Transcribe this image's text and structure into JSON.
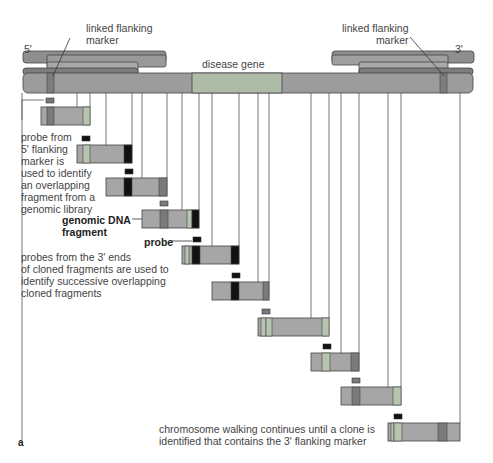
{
  "labels": {
    "five_prime": "5'",
    "three_prime": "3'",
    "left_marker": "linked flanking\nmarker",
    "right_marker": "linked flanking\nmarker",
    "disease_gene": "disease gene",
    "probe_5prime": "probe from\n5' flanking\nmarker is\nused to identify\nan overlapping\nfragment from a\ngenomic library",
    "genomic_fragment": "genomic DNA\nfragment",
    "probe": "probe",
    "probes_3prime": "probes from the 3' ends\nof cloned fragments are used to\nidentify successive overlapping\ncloned fragments",
    "walking_continues": "chromosome walking continues until a clone is\nidentified that contains the 3' flanking marker",
    "panel": "a"
  },
  "colors": {
    "chromosome": "#9c9c9c",
    "chromosome_dark": "#7d7d7d",
    "disease_gene": "#aebba6",
    "fragment": "#a6a6a6",
    "light_band": "#b6c4b0",
    "dark_band": "#7a7a7a",
    "probe_band": "#111111",
    "line": "#666666"
  },
  "fragments": [
    {
      "x": 41,
      "y": 107,
      "w": 49,
      "probe": {
        "x": 46,
        "y": 98,
        "dark": false
      },
      "bands": [
        {
          "x": 47,
          "w": 7,
          "c": "dark"
        },
        {
          "x": 83,
          "w": 7,
          "c": "light"
        }
      ]
    },
    {
      "x": 77,
      "y": 145,
      "w": 55,
      "probe": {
        "x": 82,
        "y": 136,
        "dark": true
      },
      "bands": [
        {
          "x": 83,
          "w": 7,
          "c": "light"
        },
        {
          "x": 124,
          "w": 8,
          "c": "black"
        }
      ]
    },
    {
      "x": 106,
      "y": 178,
      "w": 61,
      "probe": {
        "x": 125,
        "y": 169,
        "dark": true
      },
      "bands": [
        {
          "x": 124,
          "w": 8,
          "c": "black"
        },
        {
          "x": 159,
          "w": 8,
          "c": "dark"
        }
      ]
    },
    {
      "x": 142,
      "y": 210,
      "w": 57,
      "probe": {
        "x": 160,
        "y": 201,
        "dark": false
      },
      "bands": [
        {
          "x": 160,
          "w": 8,
          "c": "dark"
        },
        {
          "x": 187,
          "w": 5,
          "c": "light"
        },
        {
          "x": 192,
          "w": 7,
          "c": "black"
        }
      ]
    },
    {
      "x": 182,
      "y": 246,
      "w": 57,
      "probe": {
        "x": 193,
        "y": 237,
        "dark": true
      },
      "bands": [
        {
          "x": 185,
          "w": 4,
          "c": "light"
        },
        {
          "x": 192,
          "w": 8,
          "c": "black"
        },
        {
          "x": 231,
          "w": 8,
          "c": "black"
        }
      ]
    },
    {
      "x": 212,
      "y": 282,
      "w": 57,
      "probe": {
        "x": 232,
        "y": 273,
        "dark": true
      },
      "bands": [
        {
          "x": 231,
          "w": 8,
          "c": "black"
        },
        {
          "x": 263,
          "w": 6,
          "c": "dark"
        }
      ]
    },
    {
      "x": 258,
      "y": 318,
      "w": 71,
      "probe": {
        "x": 262,
        "y": 309,
        "dark": false
      },
      "bands": [
        {
          "x": 261,
          "w": 5,
          "c": "light"
        },
        {
          "x": 266,
          "w": 6,
          "c": "light"
        },
        {
          "x": 322,
          "w": 7,
          "c": "light"
        }
      ]
    },
    {
      "x": 311,
      "y": 353,
      "w": 48,
      "probe": {
        "x": 323,
        "y": 344,
        "dark": true
      },
      "bands": [
        {
          "x": 322,
          "w": 8,
          "c": "light"
        },
        {
          "x": 351,
          "w": 8,
          "c": "dark"
        }
      ]
    },
    {
      "x": 341,
      "y": 387,
      "w": 60,
      "probe": {
        "x": 352,
        "y": 378,
        "dark": false
      },
      "bands": [
        {
          "x": 352,
          "w": 8,
          "c": "dark"
        },
        {
          "x": 393,
          "w": 8,
          "c": "light"
        }
      ]
    },
    {
      "x": 388,
      "y": 423,
      "w": 72,
      "probe": {
        "x": 394,
        "y": 414,
        "dark": true
      },
      "bands": [
        {
          "x": 391,
          "w": 3,
          "c": "light"
        },
        {
          "x": 394,
          "w": 8,
          "c": "light"
        },
        {
          "x": 438,
          "w": 9,
          "c": "dark"
        }
      ]
    }
  ],
  "vlines": [
    22,
    77,
    90,
    106,
    132,
    142,
    167,
    182,
    199,
    212,
    239,
    258,
    269,
    311,
    329,
    341,
    359,
    388,
    401,
    460
  ]
}
